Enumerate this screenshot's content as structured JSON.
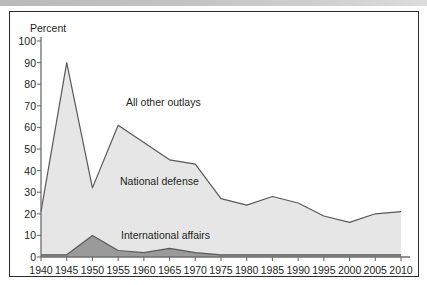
{
  "figure": {
    "border_color": "#2b2b33",
    "background": "#ffffff"
  },
  "topbar": {
    "name": "page-top-gradient-bar"
  },
  "axes": {
    "y_axis_title": "Percent",
    "y_ticks": [
      "100",
      "90",
      "80",
      "70",
      "60",
      "50",
      "40",
      "30",
      "20",
      "10",
      "0"
    ],
    "x_ticks": [
      "1940",
      "1945",
      "1950",
      "1955",
      "1960",
      "1965",
      "1970",
      "1975",
      "1980",
      "1985",
      "1990",
      "1995",
      "2000",
      "2005",
      "2010"
    ]
  },
  "labels": {
    "all_other_outlays": "All other outlays",
    "national_defense": "National defense",
    "international_affairs": "International affairs"
  },
  "colors": {
    "all_other_outlays_fill": "#e6e6e6",
    "international_affairs_fill": "#9a9a9a",
    "line": "#595959",
    "axis": "#6e6e6e",
    "text": "#231f20"
  },
  "chart_data": {
    "type": "area",
    "title": "",
    "xlabel": "",
    "ylabel": "Percent",
    "xlim": [
      1940,
      2010
    ],
    "ylim": [
      0,
      100
    ],
    "grid": false,
    "legend": "inline-labels",
    "x": [
      1940,
      1945,
      1950,
      1955,
      1960,
      1965,
      1970,
      1975,
      1980,
      1985,
      1990,
      1995,
      2000,
      2005,
      2010
    ],
    "series": [
      {
        "name": "All other outlays",
        "note": "upper boundary of stacked total (defense + international affairs)",
        "values": [
          21,
          90,
          32,
          61,
          53,
          45,
          43,
          27,
          24,
          28,
          25,
          19,
          16,
          20,
          21
        ]
      },
      {
        "name": "International affairs",
        "note": "bottom band",
        "values": [
          1,
          1,
          10,
          3,
          2,
          4,
          2,
          1,
          1,
          1,
          1,
          1,
          1,
          1,
          1
        ]
      }
    ],
    "annotations": [
      {
        "text": "All other outlays",
        "x": 1957,
        "y": 72
      },
      {
        "text": "National defense",
        "x": 1956,
        "y": 41
      },
      {
        "text": "International affairs",
        "x": 1957,
        "y": 9
      }
    ]
  }
}
